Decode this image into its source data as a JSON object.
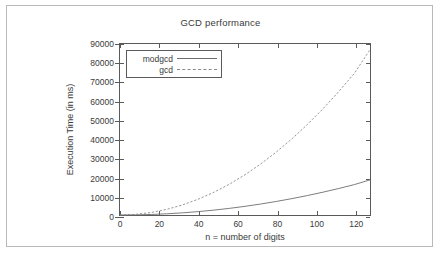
{
  "figure": {
    "title": "GCD performance",
    "background": "#ffffff",
    "border_color": "#b9b9b9",
    "axis_color": "#5a5a5a"
  },
  "legend": {
    "position": "top-left-inside",
    "entries": [
      {
        "label": "modgcd",
        "style": "solid",
        "color": "#6e6e6e"
      },
      {
        "label": "gcd",
        "style": "dashed",
        "color": "#8a8a8a"
      }
    ]
  },
  "chart_data": {
    "type": "line",
    "title": "GCD performance",
    "xlabel": "n = number of digits",
    "ylabel": "Execution Time (in ms)",
    "xlim": [
      0,
      128
    ],
    "ylim": [
      0,
      90000
    ],
    "xticks": [
      0,
      20,
      40,
      60,
      80,
      100,
      120
    ],
    "yticks": [
      0,
      10000,
      20000,
      30000,
      40000,
      50000,
      60000,
      70000,
      80000,
      90000
    ],
    "grid": false,
    "legend_position": "upper left",
    "x": [
      0,
      8,
      16,
      24,
      32,
      40,
      48,
      56,
      64,
      72,
      80,
      88,
      96,
      104,
      112,
      120,
      128
    ],
    "series": [
      {
        "name": "modgcd",
        "style": "solid",
        "color": "#6e6e6e",
        "values": [
          0,
          70,
          280,
          640,
          1140,
          1780,
          2560,
          3490,
          4560,
          5770,
          7120,
          8620,
          10250,
          12030,
          13950,
          16010,
          18500
        ]
      },
      {
        "name": "gcd",
        "style": "dashed",
        "color": "#8a8a8a",
        "values": [
          0,
          330,
          1320,
          2980,
          5300,
          8280,
          11920,
          16230,
          21200,
          26830,
          33120,
          40080,
          47700,
          55990,
          64940,
          74560,
          87000
        ]
      }
    ]
  }
}
